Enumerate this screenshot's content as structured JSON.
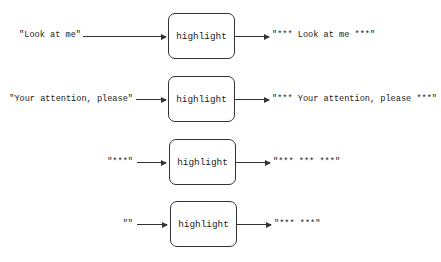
{
  "diagram": {
    "function_name": "highlight",
    "rows": [
      {
        "input": "\"Look at me\"",
        "function": "highlight",
        "output": "\"*** Look at me ***\""
      },
      {
        "input": "\"Your attention, please\"",
        "function": "highlight",
        "output": "\"*** Your attention, please ***\""
      },
      {
        "input": "\"***\"",
        "function": "highlight",
        "output": "\"*** *** ***\""
      },
      {
        "input": "\"\"",
        "function": "highlight",
        "output": "\"*** ***\""
      }
    ]
  }
}
